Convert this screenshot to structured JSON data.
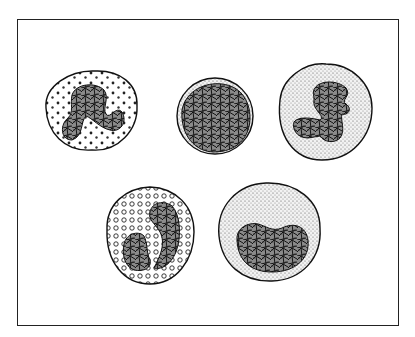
{
  "figure": {
    "title": "",
    "cells": [
      {
        "id": "cell-1",
        "type": "neutrophil",
        "nucleus": "segmented",
        "granules": "dots"
      },
      {
        "id": "cell-2",
        "type": "small lymphocyte",
        "nucleus": "round reticulated",
        "granules": "none"
      },
      {
        "id": "cell-3",
        "type": "monocyte",
        "nucleus": "lobulated",
        "granules": "fine stipple"
      },
      {
        "id": "cell-4",
        "type": "eosinophil",
        "nucleus": "bilobed",
        "granules": "rings"
      },
      {
        "id": "cell-5",
        "type": "large lymphocyte",
        "nucleus": "kidney-shaped reticulated",
        "granules": "fine stipple"
      }
    ]
  },
  "colors": {
    "ink": "#1a1a1a",
    "paper": "#ffffff",
    "nucleus_fill": "#6e6e6e",
    "stipple": "#cfcfcf"
  }
}
